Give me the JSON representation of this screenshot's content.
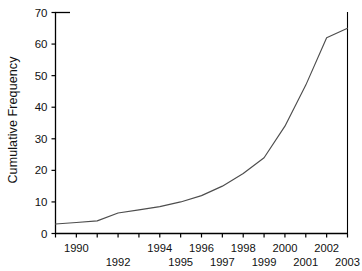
{
  "chart_data": {
    "type": "line",
    "title": "",
    "xlabel": "",
    "ylabel": "Cumulative Frequency",
    "xlim": [
      1989,
      2003
    ],
    "ylim": [
      0,
      70
    ],
    "grid": false,
    "legend": "none",
    "line_color": "#4d4d4d",
    "axis_color": "#000000",
    "background": "#ffffff",
    "y_ticks": [
      0,
      10,
      20,
      30,
      40,
      50,
      60,
      70
    ],
    "x_ticks": [
      1989,
      1990,
      1991,
      1992,
      1993,
      1994,
      1995,
      1996,
      1997,
      1998,
      1999,
      2000,
      2001,
      2002,
      2003
    ],
    "x_tick_labels_top": [
      "1990",
      "1994",
      "1996",
      "1998",
      "2000",
      "2002"
    ],
    "x_tick_labels_bottom": [
      "1992",
      "1995",
      "1997",
      "1999",
      "2001",
      "2003"
    ],
    "x": [
      1989,
      1990,
      1991,
      1992,
      1993,
      1994,
      1995,
      1996,
      1997,
      1998,
      1999,
      2000,
      2001,
      2002,
      2003
    ],
    "values": [
      3,
      3.5,
      4,
      6.5,
      7.5,
      8.5,
      10,
      12,
      15,
      19,
      24,
      34,
      47,
      62,
      65
    ],
    "series": [
      {
        "name": "Cumulative Frequency",
        "values": [
          3,
          3.5,
          4,
          6.5,
          7.5,
          8.5,
          10,
          12,
          15,
          19,
          24,
          34,
          47,
          62,
          65
        ]
      }
    ]
  },
  "axis": {
    "y_tick_labels": [
      "0",
      "10",
      "20",
      "30",
      "40",
      "50",
      "60",
      "70"
    ],
    "x_labels_top": [
      {
        "year": "1990",
        "pos": 1990
      },
      {
        "year": "1994",
        "pos": 1994
      },
      {
        "year": "1996",
        "pos": 1996
      },
      {
        "year": "1998",
        "pos": 1998
      },
      {
        "year": "2000",
        "pos": 2000
      },
      {
        "year": "2002",
        "pos": 2002
      }
    ],
    "x_labels_bottom": [
      {
        "year": "1992",
        "pos": 1992
      },
      {
        "year": "1995",
        "pos": 1995
      },
      {
        "year": "1997",
        "pos": 1997
      },
      {
        "year": "1999",
        "pos": 1999
      },
      {
        "year": "2001",
        "pos": 2001
      },
      {
        "year": "2003",
        "pos": 2003
      }
    ]
  }
}
